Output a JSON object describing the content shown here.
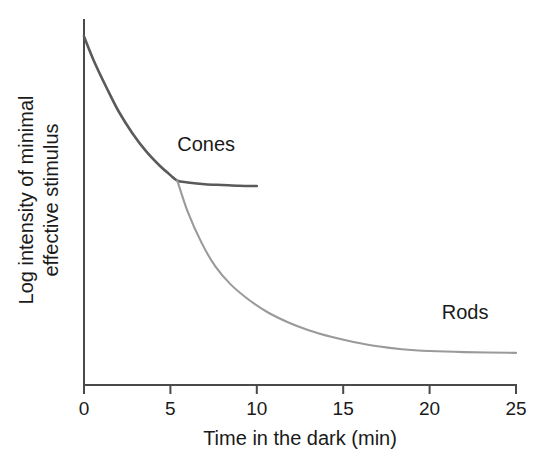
{
  "chart_data": {
    "type": "line",
    "title": "",
    "xlabel": "Time in the dark (min)",
    "ylabel_line1": "Log intensity of minimal",
    "ylabel_line2": "effective stimulus",
    "xlim": [
      0,
      25
    ],
    "ylim": [
      0,
      10
    ],
    "xticks": [
      0,
      5,
      10,
      15,
      20,
      25
    ],
    "xtick_labels": [
      "0",
      "5",
      "10",
      "15",
      "20",
      "25"
    ],
    "yticks": [],
    "ytick_labels": [],
    "grid": false,
    "legend_position": "inline-annotations",
    "series": [
      {
        "name": "Cones",
        "color": "#5a5a5a",
        "label_text": "Cones",
        "x": [
          0,
          0.6,
          1.3,
          2.0,
          2.8,
          3.6,
          4.4,
          5.0,
          5.4,
          6.0,
          7.0,
          8.0,
          9.0,
          10.0
        ],
        "y": [
          9.55,
          8.85,
          8.15,
          7.5,
          6.9,
          6.4,
          6.0,
          5.75,
          5.6,
          5.55,
          5.5,
          5.48,
          5.46,
          5.45
        ]
      },
      {
        "name": "Rods",
        "color": "#9a9a9a",
        "label_text": "Rods",
        "x": [
          5.4,
          6.0,
          6.8,
          7.6,
          8.5,
          9.5,
          10.6,
          11.8,
          13.0,
          14.3,
          15.6,
          17.0,
          18.4,
          20.0,
          22.0,
          25.0
        ],
        "y": [
          5.6,
          4.75,
          3.9,
          3.25,
          2.75,
          2.35,
          2.0,
          1.72,
          1.5,
          1.32,
          1.18,
          1.06,
          0.98,
          0.93,
          0.9,
          0.88
        ]
      }
    ],
    "annotations": [
      {
        "text": "Cones",
        "x": 5.4,
        "y": 6.6
      },
      {
        "text": "Rods",
        "x": 20.7,
        "y": 2.0
      }
    ]
  },
  "axes": {
    "axis_color": "#4a4a4a"
  }
}
